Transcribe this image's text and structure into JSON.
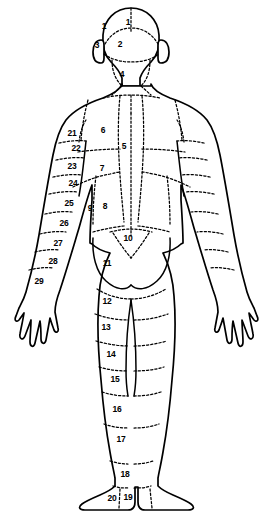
{
  "diagram": {
    "view": "back",
    "line_color": "#000000",
    "fill_color": "#ffffff",
    "zones": [
      {
        "id": "1-left",
        "label": "1",
        "x": 104,
        "y": 26,
        "region": "occipital-scalp-left"
      },
      {
        "id": "1-right",
        "label": "1",
        "x": 128,
        "y": 22,
        "region": "occipital-scalp-right"
      },
      {
        "id": "2",
        "label": "2",
        "x": 120,
        "y": 44,
        "region": "occiput"
      },
      {
        "id": "3",
        "label": "3",
        "x": 97,
        "y": 45,
        "region": "ear-preauricular-left"
      },
      {
        "id": "4",
        "label": "4",
        "x": 122,
        "y": 74,
        "region": "posterior-neck"
      },
      {
        "id": "5",
        "label": "5",
        "x": 124,
        "y": 146,
        "region": "mid-thoracic-spine"
      },
      {
        "id": "6",
        "label": "6",
        "x": 103,
        "y": 130,
        "region": "upper-back-scapular-left"
      },
      {
        "id": "7",
        "label": "7",
        "x": 102,
        "y": 168,
        "region": "mid-back-left"
      },
      {
        "id": "8",
        "label": "8",
        "x": 105,
        "y": 206,
        "region": "lower-back-left"
      },
      {
        "id": "9",
        "label": "9",
        "x": 90,
        "y": 208,
        "region": "flank-left"
      },
      {
        "id": "10",
        "label": "10",
        "x": 128,
        "y": 238,
        "region": "sacral"
      },
      {
        "id": "11",
        "label": "11",
        "x": 107,
        "y": 263,
        "region": "buttock-left"
      },
      {
        "id": "12",
        "label": "12",
        "x": 107,
        "y": 301,
        "region": "posterior-thigh-upper-left"
      },
      {
        "id": "13",
        "label": "13",
        "x": 106,
        "y": 327,
        "region": "posterior-thigh-left"
      },
      {
        "id": "14",
        "label": "14",
        "x": 111,
        "y": 354,
        "region": "posterior-thigh-lower-left"
      },
      {
        "id": "15",
        "label": "15",
        "x": 115,
        "y": 379,
        "region": "knee-popliteal-left"
      },
      {
        "id": "16",
        "label": "16",
        "x": 117,
        "y": 409,
        "region": "calf-upper-left"
      },
      {
        "id": "17",
        "label": "17",
        "x": 121,
        "y": 439,
        "region": "calf-lower-left"
      },
      {
        "id": "18",
        "label": "18",
        "x": 125,
        "y": 474,
        "region": "ankle-left"
      },
      {
        "id": "19",
        "label": "19",
        "x": 128,
        "y": 497,
        "region": "foot-left"
      },
      {
        "id": "20",
        "label": "20",
        "x": 112,
        "y": 498,
        "region": "heel-left"
      },
      {
        "id": "21",
        "label": "21",
        "x": 72,
        "y": 133,
        "region": "shoulder-deltoid-left"
      },
      {
        "id": "22",
        "label": "22",
        "x": 76,
        "y": 148,
        "region": "upper-arm-posterior-left-1"
      },
      {
        "id": "23",
        "label": "23",
        "x": 72,
        "y": 166,
        "region": "upper-arm-posterior-left-2"
      },
      {
        "id": "24",
        "label": "24",
        "x": 73,
        "y": 183,
        "region": "upper-arm-posterior-left-3"
      },
      {
        "id": "25",
        "label": "25",
        "x": 69,
        "y": 203,
        "region": "elbow-left"
      },
      {
        "id": "26",
        "label": "26",
        "x": 64,
        "y": 223,
        "region": "forearm-posterior-left-1"
      },
      {
        "id": "27",
        "label": "27",
        "x": 58,
        "y": 243,
        "region": "forearm-posterior-left-2"
      },
      {
        "id": "28",
        "label": "28",
        "x": 53,
        "y": 261,
        "region": "wrist-left"
      },
      {
        "id": "29",
        "label": "29",
        "x": 39,
        "y": 281,
        "region": "hand-dorsum-left"
      }
    ]
  }
}
